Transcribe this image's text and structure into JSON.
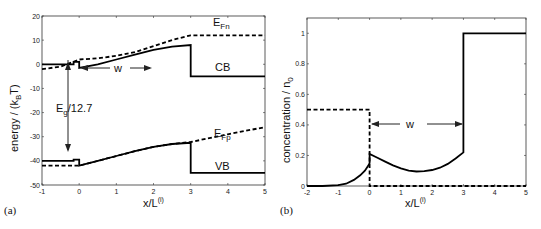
{
  "chart_data": [
    {
      "type": "line",
      "panel_label": "(a)",
      "xlabel": "x/L",
      "xlabel_sup": "(i)",
      "ylabel": "energy / (k",
      "ylabel_sub": "B",
      "ylabel_end": "T)",
      "xlim": [
        -1,
        5
      ],
      "ylim": [
        -50,
        20
      ],
      "xticks": [
        -1,
        0,
        1,
        2,
        3,
        4,
        5
      ],
      "yticks": [
        -50,
        -40,
        -30,
        -20,
        -10,
        0,
        10,
        20
      ],
      "grid": false,
      "annotations": [
        {
          "text": "E",
          "sub": "Fn",
          "x": 3.5,
          "y": 15
        },
        {
          "text": "CB",
          "x": 3.6,
          "y": -2
        },
        {
          "text": "w",
          "x": 1.1,
          "y": -11
        },
        {
          "text": "E",
          "sub": "g",
          "suffix": "/12.7",
          "x": -0.85,
          "y": -22
        },
        {
          "text": "E",
          "sub": "Fp",
          "x": 3.6,
          "y": -20
        },
        {
          "text": "VB",
          "x": 3.6,
          "y": -42
        }
      ],
      "series": [
        {
          "name": "CB",
          "style": "solid",
          "x": [
            -1,
            -0.15,
            -0.15,
            0,
            0,
            0.5,
            1,
            1.5,
            2,
            2.5,
            3,
            3,
            5
          ],
          "y": [
            0,
            0,
            1,
            1,
            -1.5,
            0,
            2,
            4,
            6,
            7.3,
            8,
            -5,
            -5
          ]
        },
        {
          "name": "E_Fn",
          "style": "dashed",
          "x": [
            -1,
            -0.5,
            0,
            0.5,
            1,
            1.5,
            2,
            2.5,
            3,
            5
          ],
          "y": [
            -2,
            -1,
            2,
            2.5,
            3.5,
            5,
            7.5,
            10,
            12,
            12
          ]
        },
        {
          "name": "VB",
          "style": "solid",
          "x": [
            -1,
            -0.15,
            -0.15,
            0,
            0,
            0.5,
            1,
            1.5,
            2,
            2.5,
            3,
            3,
            5
          ],
          "y": [
            -40,
            -40,
            -39.5,
            -39.5,
            -42,
            -40,
            -38,
            -36,
            -34.2,
            -33,
            -32.5,
            -45,
            -45
          ]
        },
        {
          "name": "E_Fp",
          "style": "dashed",
          "x": [
            -1,
            0,
            0.5,
            1,
            1.5,
            2,
            2.5,
            3,
            4,
            5
          ],
          "y": [
            -42,
            -42,
            -40,
            -38,
            -36,
            -34.2,
            -33,
            -32.2,
            -29,
            -26
          ]
        }
      ]
    },
    {
      "type": "line",
      "panel_label": "(b)",
      "xlabel": "x/L",
      "xlabel_sup": "(i)",
      "ylabel": "concentration / n",
      "ylabel_sub": "0",
      "xlim": [
        -2,
        5
      ],
      "ylim": [
        0,
        1.1
      ],
      "xticks": [
        -2,
        -1,
        0,
        1,
        2,
        3,
        4,
        5
      ],
      "yticks": [
        0,
        0.2,
        0.4,
        0.6,
        0.8,
        1
      ],
      "grid": false,
      "annotations": [
        {
          "text": "w",
          "x": 1.5,
          "y": 0.42
        }
      ],
      "series": [
        {
          "name": "solid",
          "style": "solid",
          "x": [
            -2,
            -1.5,
            -1,
            -0.75,
            -0.5,
            -0.3,
            -0.15,
            -0.05,
            0,
            0,
            0.25,
            0.5,
            0.75,
            1,
            1.25,
            1.5,
            1.75,
            2,
            2.25,
            2.5,
            2.75,
            3,
            3,
            5
          ],
          "y": [
            0,
            0,
            0.005,
            0.015,
            0.04,
            0.07,
            0.1,
            0.13,
            0.15,
            0.21,
            0.185,
            0.16,
            0.135,
            0.115,
            0.1,
            0.095,
            0.097,
            0.105,
            0.12,
            0.145,
            0.18,
            0.22,
            1.0,
            1.0
          ]
        },
        {
          "name": "dashed",
          "style": "dashed",
          "x": [
            -2,
            0,
            0,
            3,
            3,
            5
          ],
          "y": [
            0.5,
            0.5,
            0,
            0,
            0,
            0
          ]
        }
      ]
    }
  ]
}
